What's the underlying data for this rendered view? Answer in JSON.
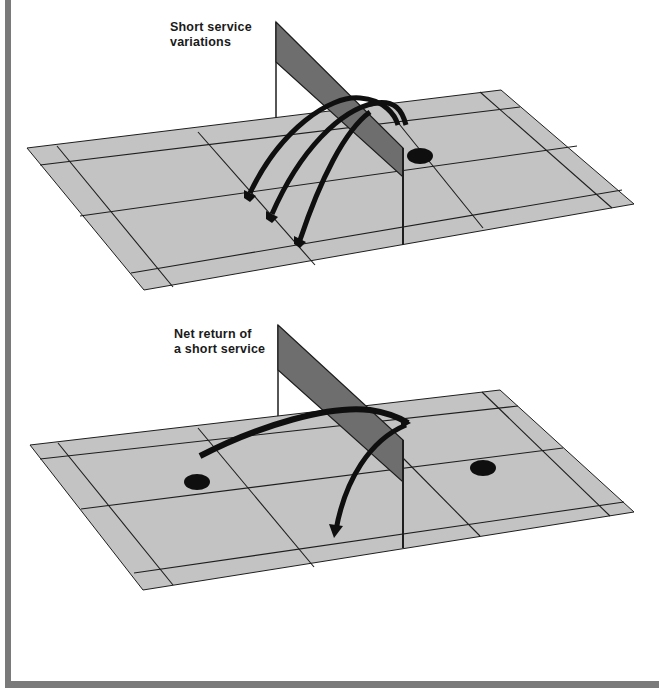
{
  "figures": [
    {
      "id": "top",
      "caption_line1": "Short service",
      "caption_line2": "variations",
      "elements": [
        "court",
        "net",
        "receiver-dot",
        "three-service-arrows"
      ]
    },
    {
      "id": "bottom",
      "caption_line1": "Net return of",
      "caption_line2": "a short service",
      "elements": [
        "court",
        "net",
        "two-player-dots",
        "serve-arrow",
        "net-return-arrow"
      ]
    }
  ],
  "colors": {
    "court": "#c3c3c3",
    "lines": "#1e1e1e",
    "net": "#6e6e6e",
    "arrow": "#0f0f0f",
    "frame": "#7a7a7a",
    "background": "#ffffff"
  }
}
